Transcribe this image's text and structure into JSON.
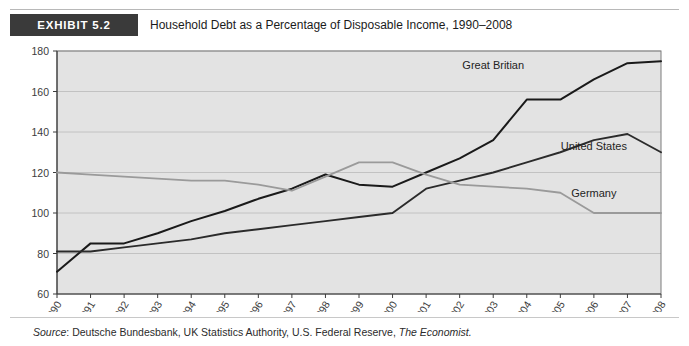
{
  "exhibit": {
    "badge": "EXHIBIT 5.2",
    "title": "Household Debt as a Percentage of Disposable Income, 1990–2008"
  },
  "source": {
    "prefix": "Source",
    "colon": ": ",
    "text": "Deutsche Bundesbank, UK Statistics Authority, U.S. Federal Reserve, ",
    "italic_tail": "The Economist."
  },
  "chart_data": {
    "type": "line",
    "title": "Household Debt as a Percentage of Disposable Income, 1990–2008",
    "xlabel": "",
    "ylabel": "",
    "xlim": [
      1990,
      2008
    ],
    "ylim": [
      60,
      180
    ],
    "yticks": [
      60,
      80,
      100,
      120,
      140,
      160,
      180
    ],
    "grid": true,
    "legend_position": "inline-labels",
    "plot_background": "#e3e3e3",
    "categories": [
      "1990",
      "1991",
      "1992",
      "1993",
      "1994",
      "1995",
      "1996",
      "1997",
      "1998",
      "1999",
      "2000",
      "2001",
      "2002",
      "2003",
      "2004",
      "2005",
      "2006",
      "2007",
      "2008"
    ],
    "series": [
      {
        "name": "Great Britian",
        "color": "#1a1a1a",
        "width": 2.0,
        "values": [
          71,
          85,
          85,
          90,
          96,
          101,
          107,
          112,
          119,
          114,
          113,
          120,
          127,
          136,
          156,
          156,
          166,
          174,
          175
        ]
      },
      {
        "name": "United States",
        "color": "#2b2b2b",
        "width": 1.9,
        "values": [
          81,
          81,
          83,
          85,
          87,
          90,
          92,
          94,
          96,
          98,
          100,
          112,
          116,
          120,
          125,
          130,
          136,
          139,
          130
        ]
      },
      {
        "name": "Germany",
        "color": "#9a9a9a",
        "width": 1.8,
        "values": [
          120,
          119,
          118,
          117,
          116,
          116,
          114,
          111,
          118,
          125,
          125,
          119,
          114,
          113,
          112,
          110,
          100,
          100,
          100
        ]
      }
    ],
    "annotations": [
      {
        "text": "Great Britian",
        "x": 2003,
        "y": 171
      },
      {
        "text": "United States",
        "x": 2006,
        "y": 131
      },
      {
        "text": "Germany",
        "x": 2006,
        "y": 108
      }
    ]
  }
}
